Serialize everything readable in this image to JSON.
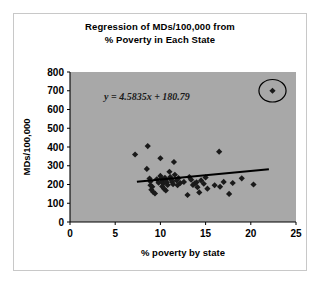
{
  "chart_data": {
    "type": "scatter",
    "title": "Regression of MDs/100,000 from % Poverty in Each State",
    "title_line1": "Regression of MDs/100,000 from",
    "title_line2": "% Poverty in Each State",
    "xlabel": "% poverty by state",
    "ylabel": "MDs/100,000",
    "xlim": [
      0,
      25
    ],
    "ylim": [
      0,
      800
    ],
    "xticks": [
      0,
      5,
      10,
      15,
      20,
      25
    ],
    "yticks": [
      0,
      100,
      200,
      300,
      400,
      500,
      600,
      700,
      800
    ],
    "xtick_labels": [
      "0",
      "5",
      "10",
      "15",
      "20",
      "25"
    ],
    "ytick_labels": [
      "0",
      "100",
      "200",
      "300",
      "400",
      "500",
      "600",
      "700",
      "800"
    ],
    "grid": false,
    "plot_background": "#a8a8a8",
    "marker": "diamond",
    "marker_color": "#1a1a1a",
    "trendline": {
      "equation_label": "y = 4.5835x + 180.79",
      "slope": 4.5835,
      "intercept": 180.79,
      "color": "#000000",
      "x_start": 7.4,
      "x_end": 22.0
    },
    "annotation": {
      "type": "ellipse-highlight",
      "label": "outlier-circle",
      "center_x": 22.4,
      "center_y": 700,
      "rx_data": 1.5,
      "ry_data": 60
    },
    "points": [
      {
        "x": 7.2,
        "y": 360
      },
      {
        "x": 8.6,
        "y": 405
      },
      {
        "x": 8.5,
        "y": 283
      },
      {
        "x": 8.8,
        "y": 232
      },
      {
        "x": 8.9,
        "y": 216
      },
      {
        "x": 8.9,
        "y": 196
      },
      {
        "x": 9.1,
        "y": 188
      },
      {
        "x": 9.0,
        "y": 172
      },
      {
        "x": 9.2,
        "y": 160
      },
      {
        "x": 9.4,
        "y": 152
      },
      {
        "x": 9.6,
        "y": 228
      },
      {
        "x": 9.8,
        "y": 210
      },
      {
        "x": 10.0,
        "y": 340
      },
      {
        "x": 10.0,
        "y": 246
      },
      {
        "x": 10.1,
        "y": 232
      },
      {
        "x": 10.2,
        "y": 218
      },
      {
        "x": 10.3,
        "y": 205
      },
      {
        "x": 10.2,
        "y": 190
      },
      {
        "x": 10.4,
        "y": 178
      },
      {
        "x": 10.5,
        "y": 236
      },
      {
        "x": 10.6,
        "y": 224
      },
      {
        "x": 10.7,
        "y": 212
      },
      {
        "x": 10.8,
        "y": 198
      },
      {
        "x": 10.6,
        "y": 168
      },
      {
        "x": 11.0,
        "y": 268
      },
      {
        "x": 11.1,
        "y": 240
      },
      {
        "x": 11.2,
        "y": 226
      },
      {
        "x": 11.3,
        "y": 214
      },
      {
        "x": 11.4,
        "y": 202
      },
      {
        "x": 11.5,
        "y": 320
      },
      {
        "x": 11.6,
        "y": 252
      },
      {
        "x": 11.8,
        "y": 222
      },
      {
        "x": 11.9,
        "y": 196
      },
      {
        "x": 12.0,
        "y": 234
      },
      {
        "x": 12.2,
        "y": 208
      },
      {
        "x": 12.6,
        "y": 214
      },
      {
        "x": 13.0,
        "y": 144
      },
      {
        "x": 13.2,
        "y": 240
      },
      {
        "x": 13.4,
        "y": 226
      },
      {
        "x": 13.6,
        "y": 198
      },
      {
        "x": 13.8,
        "y": 206
      },
      {
        "x": 14.0,
        "y": 212
      },
      {
        "x": 14.1,
        "y": 186
      },
      {
        "x": 14.3,
        "y": 158
      },
      {
        "x": 14.5,
        "y": 222
      },
      {
        "x": 14.8,
        "y": 204
      },
      {
        "x": 15.0,
        "y": 238
      },
      {
        "x": 15.2,
        "y": 178
      },
      {
        "x": 16.0,
        "y": 196
      },
      {
        "x": 16.5,
        "y": 375
      },
      {
        "x": 16.6,
        "y": 188
      },
      {
        "x": 17.0,
        "y": 214
      },
      {
        "x": 17.6,
        "y": 150
      },
      {
        "x": 18.0,
        "y": 208
      },
      {
        "x": 19.0,
        "y": 233
      },
      {
        "x": 20.3,
        "y": 200
      },
      {
        "x": 22.4,
        "y": 700
      }
    ]
  }
}
